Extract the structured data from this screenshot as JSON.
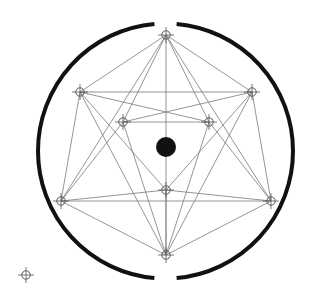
{
  "diagram": {
    "title": "",
    "colors": {
      "ring": "#111111",
      "edge": "#7a7a7a",
      "node": "#555555",
      "center": "#111111",
      "background": "#ffffff"
    },
    "ring": {
      "cx": 165.5,
      "cy": 151,
      "r": 127.5,
      "gap_top_deg": 10,
      "gap_bottom_deg": 10
    },
    "center_dot": {
      "cx": 166,
      "cy": 147,
      "r": 10
    },
    "nodes": [
      {
        "id": "T",
        "x": 166,
        "y": 35
      },
      {
        "id": "UL",
        "x": 80,
        "y": 92
      },
      {
        "id": "UR",
        "x": 252,
        "y": 92
      },
      {
        "id": "IL",
        "x": 123,
        "y": 122
      },
      {
        "id": "IR",
        "x": 209,
        "y": 122
      },
      {
        "id": "IB",
        "x": 166,
        "y": 190
      },
      {
        "id": "LL",
        "x": 61,
        "y": 201
      },
      {
        "id": "LR",
        "x": 271,
        "y": 201
      },
      {
        "id": "B",
        "x": 166,
        "y": 255
      }
    ],
    "standalone_marker": {
      "x": 26,
      "y": 275
    },
    "edges": [
      [
        "T",
        "UL"
      ],
      [
        "T",
        "UR"
      ],
      [
        "T",
        "LL"
      ],
      [
        "T",
        "LR"
      ],
      [
        "T",
        "B"
      ],
      [
        "T",
        "IL"
      ],
      [
        "T",
        "IR"
      ],
      [
        "UL",
        "UR"
      ],
      [
        "UL",
        "IR"
      ],
      [
        "UL",
        "LL"
      ],
      [
        "UL",
        "IB"
      ],
      [
        "UL",
        "B"
      ],
      [
        "UR",
        "IL"
      ],
      [
        "UR",
        "LR"
      ],
      [
        "UR",
        "IB"
      ],
      [
        "UR",
        "B"
      ],
      [
        "IL",
        "IR"
      ],
      [
        "IL",
        "B"
      ],
      [
        "IL",
        "LL"
      ],
      [
        "IR",
        "B"
      ],
      [
        "IR",
        "LR"
      ],
      [
        "IB",
        "LL"
      ],
      [
        "IB",
        "LR"
      ],
      [
        "IB",
        "B"
      ],
      [
        "LL",
        "LR"
      ],
      [
        "LL",
        "B"
      ],
      [
        "LR",
        "B"
      ]
    ]
  }
}
